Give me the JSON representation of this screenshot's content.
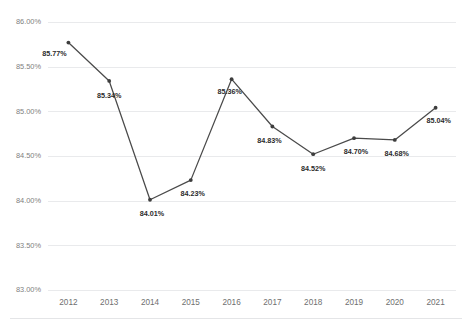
{
  "chart_data": {
    "type": "line",
    "title": "",
    "subtitle": "",
    "xlabel": "",
    "ylabel": "",
    "categories": [
      "2012",
      "2013",
      "2014",
      "2015",
      "2016",
      "2017",
      "2018",
      "2019",
      "2020",
      "2021"
    ],
    "values": [
      85.77,
      85.34,
      84.01,
      84.23,
      85.36,
      84.83,
      84.52,
      84.7,
      84.68,
      85.04
    ],
    "point_labels": [
      "85.77%",
      "85.34%",
      "84.01%",
      "84.23%",
      "85.36%",
      "84.83%",
      "84.52%",
      "84.70%",
      "84.68%",
      "85.04%"
    ],
    "ylim": [
      83.0,
      86.0
    ],
    "ytick_values": [
      86.0,
      85.5,
      85.0,
      84.5,
      84.0,
      83.5,
      83.0
    ],
    "ytick_labels": [
      "86.00%",
      "85.50%",
      "85.00%",
      "84.50%",
      "84.00%",
      "83.50%",
      "83.00%"
    ],
    "grid": true,
    "legend": false,
    "legend_position": "none",
    "series": [
      {
        "name": "Series 1",
        "values": [
          85.77,
          85.34,
          84.01,
          84.23,
          85.36,
          84.83,
          84.52,
          84.7,
          84.68,
          85.04
        ],
        "color": "#4a4a4a",
        "marker": "circle"
      }
    ]
  },
  "style": {
    "line_color": "#4a4a4a",
    "marker_color": "#3d3d3d",
    "grid_color": "#e9eaec",
    "axis_text_color": "#808080",
    "label_text_color": "#2b2b2b",
    "background": "#ffffff"
  }
}
